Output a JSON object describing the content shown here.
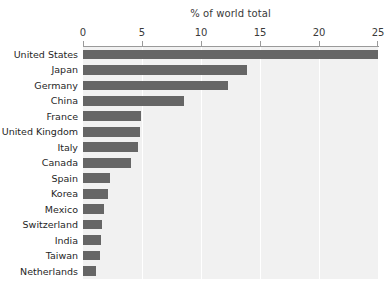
{
  "chart_data": {
    "type": "bar",
    "orientation": "horizontal",
    "title": "% of world total",
    "xlabel": "",
    "ylabel": "",
    "xlim": [
      0,
      25
    ],
    "xticks": [
      0,
      5,
      10,
      15,
      20,
      25
    ],
    "xtick_labels": [
      "0",
      "5",
      "10",
      "15",
      "20",
      "25"
    ],
    "grid": "vertical-white",
    "legend": "none",
    "categories": [
      "United States",
      "Japan",
      "Germany",
      "China",
      "France",
      "United Kingdom",
      "Italy",
      "Canada",
      "Spain",
      "Korea",
      "Mexico",
      "Switzerland",
      "India",
      "Taiwan",
      "Netherlands"
    ],
    "values": [
      25.0,
      13.9,
      12.3,
      8.6,
      4.9,
      4.8,
      4.7,
      4.1,
      2.3,
      2.1,
      1.8,
      1.6,
      1.5,
      1.4,
      1.1
    ],
    "bar_color": "#666666",
    "plot_background": "#f1f1f1",
    "gridline_color": "#ffffff",
    "axis_color": "#9a9a9a",
    "page_background": "#ffffff",
    "text_color": "#1f1f1f"
  }
}
